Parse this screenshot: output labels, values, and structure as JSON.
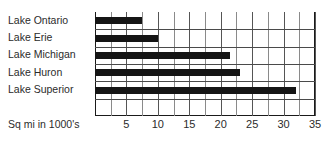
{
  "chart_data": {
    "type": "bar",
    "orientation": "horizontal",
    "title": "",
    "subtitle": "",
    "xlabel": "Sq mi in 1000's",
    "ylabel": "",
    "categories": [
      "Lake Ontario",
      "Lake Erie",
      "Lake Michigan",
      "Lake Huron",
      "Lake Superior"
    ],
    "values": [
      7.5,
      10,
      21.5,
      23,
      32
    ],
    "series": [
      {
        "name": "Area",
        "values": [
          7.5,
          10,
          21.5,
          23,
          32
        ]
      }
    ],
    "xlim": [
      0,
      35
    ],
    "ylim": null,
    "xticks": [
      0,
      5,
      10,
      15,
      20,
      25,
      30,
      35
    ],
    "xtick_labels": [
      "",
      "5",
      "10",
      "15",
      "20",
      "25",
      "30",
      "35"
    ],
    "minor_tick_interval": 2.5,
    "grid": true,
    "grid_axis": "x",
    "legend": false,
    "legend_position": "none",
    "bar_color": "#151515",
    "axis_color": "#1a1a1a",
    "gridline_color": "#555555",
    "text_color": "#2b2b2b",
    "background_color": "#ffffff",
    "annotations": []
  },
  "axis": {
    "caption": "Sq mi in 1000's"
  }
}
